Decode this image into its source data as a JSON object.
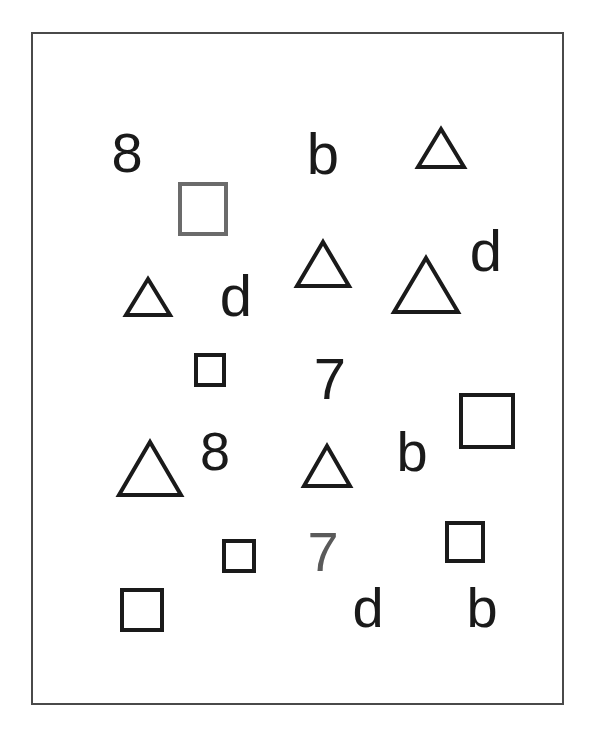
{
  "stimulus": {
    "name": "visual-search-array",
    "background_color": "#ffffff",
    "frame": {
      "border_color": "#4a4a4a",
      "border_width_px": 2,
      "x": 31,
      "y": 32,
      "width": 533,
      "height": 673
    },
    "colors": {
      "black": "#1a1a1a",
      "gray": "#6b6b6b",
      "gray_digit": "#5a5a5a"
    },
    "item_count": 22,
    "items": [
      {
        "id": "glyph-8-top-left",
        "kind": "glyph",
        "label": "8",
        "color": "#1a1a1a",
        "x": 104,
        "y": 125,
        "width": 46,
        "height": 56,
        "font_size": 56
      },
      {
        "id": "square-gray-top-left",
        "kind": "square",
        "label": "square",
        "color": "#6b6b6b",
        "x": 178,
        "y": 182,
        "width": 50,
        "height": 54,
        "stroke": 4
      },
      {
        "id": "glyph-b-top-center",
        "kind": "glyph",
        "label": "b",
        "color": "#1a1a1a",
        "x": 303,
        "y": 125,
        "width": 40,
        "height": 56,
        "font_size": 58
      },
      {
        "id": "triangle-top-right-small",
        "kind": "triangle",
        "label": "triangle",
        "color": "#1a1a1a",
        "x": 416,
        "y": 127,
        "width": 50,
        "height": 42,
        "stroke": 4
      },
      {
        "id": "triangle-center-upper",
        "kind": "triangle",
        "label": "triangle",
        "color": "#1a1a1a",
        "x": 295,
        "y": 240,
        "width": 56,
        "height": 48,
        "stroke": 4
      },
      {
        "id": "glyph-d-right-upper",
        "kind": "glyph",
        "label": "d",
        "color": "#1a1a1a",
        "x": 466,
        "y": 222,
        "width": 40,
        "height": 58,
        "font_size": 58
      },
      {
        "id": "triangle-left-small",
        "kind": "triangle",
        "label": "triangle",
        "color": "#1a1a1a",
        "x": 124,
        "y": 277,
        "width": 48,
        "height": 40,
        "stroke": 4
      },
      {
        "id": "glyph-d-center-left",
        "kind": "glyph",
        "label": "d",
        "color": "#1a1a1a",
        "x": 216,
        "y": 267,
        "width": 40,
        "height": 58,
        "font_size": 58
      },
      {
        "id": "triangle-right-large",
        "kind": "triangle",
        "label": "triangle",
        "color": "#1a1a1a",
        "x": 392,
        "y": 256,
        "width": 68,
        "height": 58,
        "stroke": 4
      },
      {
        "id": "square-small-center-left",
        "kind": "square",
        "label": "square",
        "color": "#1a1a1a",
        "x": 194,
        "y": 353,
        "width": 32,
        "height": 34,
        "stroke": 4
      },
      {
        "id": "glyph-7-center",
        "kind": "glyph",
        "label": "7",
        "color": "#1a1a1a",
        "x": 310,
        "y": 350,
        "width": 40,
        "height": 58,
        "font_size": 58
      },
      {
        "id": "square-large-right",
        "kind": "square",
        "label": "square",
        "color": "#1a1a1a",
        "x": 459,
        "y": 393,
        "width": 56,
        "height": 56,
        "stroke": 4
      },
      {
        "id": "triangle-left-large",
        "kind": "triangle",
        "label": "triangle",
        "color": "#1a1a1a",
        "x": 117,
        "y": 440,
        "width": 66,
        "height": 57,
        "stroke": 4
      },
      {
        "id": "glyph-8-center-left",
        "kind": "glyph",
        "label": "8",
        "color": "#1a1a1a",
        "x": 195,
        "y": 424,
        "width": 40,
        "height": 54,
        "font_size": 54
      },
      {
        "id": "triangle-center-lower",
        "kind": "triangle",
        "label": "triangle",
        "color": "#1a1a1a",
        "x": 302,
        "y": 444,
        "width": 50,
        "height": 44,
        "stroke": 4
      },
      {
        "id": "glyph-b-right-center",
        "kind": "glyph",
        "label": "b",
        "color": "#1a1a1a",
        "x": 392,
        "y": 424,
        "width": 40,
        "height": 56,
        "font_size": 56
      },
      {
        "id": "square-small-right-lower",
        "kind": "square",
        "label": "square",
        "color": "#1a1a1a",
        "x": 445,
        "y": 521,
        "width": 40,
        "height": 42,
        "stroke": 4
      },
      {
        "id": "square-small-center-lower",
        "kind": "square",
        "label": "square",
        "color": "#1a1a1a",
        "x": 222,
        "y": 539,
        "width": 34,
        "height": 34,
        "stroke": 4
      },
      {
        "id": "glyph-7-gray-lower",
        "kind": "glyph",
        "label": "7",
        "color": "#5a5a5a",
        "x": 303,
        "y": 524,
        "width": 40,
        "height": 56,
        "font_size": 56
      },
      {
        "id": "square-bottom-left",
        "kind": "square",
        "label": "square",
        "color": "#1a1a1a",
        "x": 120,
        "y": 588,
        "width": 44,
        "height": 44,
        "stroke": 4
      },
      {
        "id": "glyph-d-bottom",
        "kind": "glyph",
        "label": "d",
        "color": "#1a1a1a",
        "x": 348,
        "y": 580,
        "width": 40,
        "height": 56,
        "font_size": 56
      },
      {
        "id": "glyph-b-bottom-right",
        "kind": "glyph",
        "label": "b",
        "color": "#1a1a1a",
        "x": 462,
        "y": 580,
        "width": 40,
        "height": 56,
        "font_size": 56
      }
    ]
  }
}
